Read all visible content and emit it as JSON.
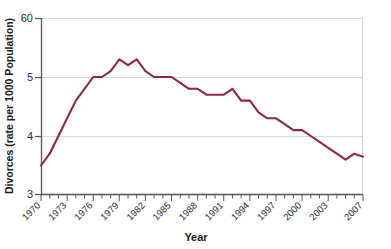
{
  "chart_data": {
    "type": "line",
    "title": "",
    "subtitle": "",
    "xlabel": "Year",
    "ylabel": "Divorces (rate per 1000 Population)",
    "grid": true,
    "legend": false,
    "legend_position": "none",
    "line_color": "#8B2942",
    "xlim": [
      1970,
      2007
    ],
    "ylim": [
      3,
      6
    ],
    "ytick_labels": [
      "60",
      "5",
      "4",
      "3"
    ],
    "ytick_values": [
      6,
      5,
      4,
      3
    ],
    "xtick_labels": [
      "1970",
      "1973",
      "1976",
      "1979",
      "1982",
      "1985",
      "1988",
      "1991",
      "1994",
      "1997",
      "2000",
      "2003",
      "2007"
    ],
    "xtick_values": [
      1970,
      1973,
      1976,
      1979,
      1982,
      1985,
      1988,
      1991,
      1994,
      1997,
      2000,
      2003,
      2007
    ],
    "x": [
      1970,
      1971,
      1972,
      1973,
      1974,
      1975,
      1976,
      1977,
      1978,
      1979,
      1980,
      1981,
      1982,
      1983,
      1984,
      1985,
      1986,
      1987,
      1988,
      1989,
      1990,
      1991,
      1992,
      1993,
      1994,
      1995,
      1996,
      1997,
      1998,
      1999,
      2000,
      2001,
      2002,
      2003,
      2004,
      2005,
      2006,
      2007
    ],
    "values": [
      3.5,
      3.7,
      4.0,
      4.3,
      4.6,
      4.8,
      5.0,
      5.0,
      5.1,
      5.3,
      5.2,
      5.3,
      5.1,
      5.0,
      5.0,
      5.0,
      4.9,
      4.8,
      4.8,
      4.7,
      4.7,
      4.7,
      4.8,
      4.6,
      4.6,
      4.4,
      4.3,
      4.3,
      4.2,
      4.1,
      4.1,
      4.0,
      3.9,
      3.8,
      3.7,
      3.6,
      3.7,
      3.65
    ],
    "annotations": []
  }
}
